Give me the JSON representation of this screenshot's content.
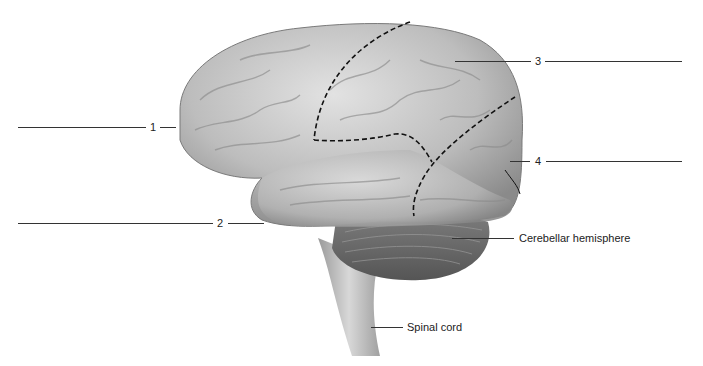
{
  "diagram": {
    "labels": [
      {
        "id": "1",
        "text": "1",
        "answer_blank": true
      },
      {
        "id": "2",
        "text": "2",
        "answer_blank": true
      },
      {
        "id": "3",
        "text": "3",
        "answer_blank": true
      },
      {
        "id": "4",
        "text": "4",
        "answer_blank": true
      },
      {
        "id": "cerebellum",
        "text": "Cerebellar hemisphere"
      },
      {
        "id": "spinal",
        "text": "Spinal cord"
      }
    ],
    "colors": {
      "background": "#ffffff",
      "brain_light": "#d9d9d9",
      "brain_mid": "#a8a8a8",
      "brain_dark": "#6e6e6e",
      "leader_line": "#333333",
      "boundary_dashes": "#111111"
    }
  }
}
